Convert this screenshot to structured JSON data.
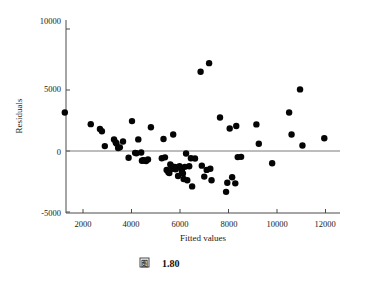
{
  "figure": {
    "caption_symbol": "图",
    "caption_number": "1.80"
  },
  "chart_data": {
    "type": "scatter",
    "title": "",
    "xlabel": "Fitted values",
    "ylabel": "Residuals",
    "xlim": [
      1100,
      12400
    ],
    "ylim": [
      -5000,
      10000
    ],
    "xticks": [
      2000,
      4000,
      6000,
      8000,
      10000,
      12000
    ],
    "xtick_labels": [
      "2000",
      "4000",
      "6000",
      "8000",
      "10000",
      "12000"
    ],
    "yticks": [
      -5000,
      0,
      5000,
      10000
    ],
    "ytick_labels": [
      "-5000",
      "0",
      "5000",
      "10000"
    ],
    "grid": false,
    "legend": null,
    "reference_line": {
      "orientation": "horizontal",
      "y": 0
    },
    "marker": {
      "shape": "circle",
      "color": "#050505",
      "size": 3.2
    },
    "points": [
      {
        "x": 1250,
        "y": 3150
      },
      {
        "x": 2320,
        "y": 2200
      },
      {
        "x": 2700,
        "y": 1800
      },
      {
        "x": 2780,
        "y": 1620
      },
      {
        "x": 2900,
        "y": 400
      },
      {
        "x": 3280,
        "y": 950
      },
      {
        "x": 3350,
        "y": 700
      },
      {
        "x": 3380,
        "y": 620
      },
      {
        "x": 3450,
        "y": 250
      },
      {
        "x": 3520,
        "y": 300
      },
      {
        "x": 3650,
        "y": 780
      },
      {
        "x": 3880,
        "y": -550
      },
      {
        "x": 4020,
        "y": 2450
      },
      {
        "x": 4150,
        "y": -150
      },
      {
        "x": 4200,
        "y": -180
      },
      {
        "x": 4280,
        "y": 950
      },
      {
        "x": 4400,
        "y": -120
      },
      {
        "x": 4430,
        "y": -800
      },
      {
        "x": 4480,
        "y": -750
      },
      {
        "x": 4520,
        "y": -780
      },
      {
        "x": 4600,
        "y": -820
      },
      {
        "x": 4680,
        "y": -700
      },
      {
        "x": 4800,
        "y": 1950
      },
      {
        "x": 5250,
        "y": -600
      },
      {
        "x": 5320,
        "y": 980
      },
      {
        "x": 5380,
        "y": -520
      },
      {
        "x": 5450,
        "y": -1550
      },
      {
        "x": 5520,
        "y": -1750
      },
      {
        "x": 5560,
        "y": -1800
      },
      {
        "x": 5600,
        "y": -1100
      },
      {
        "x": 5650,
        "y": -1250
      },
      {
        "x": 5700,
        "y": -1450
      },
      {
        "x": 5720,
        "y": 1350
      },
      {
        "x": 5780,
        "y": -1300
      },
      {
        "x": 5820,
        "y": -1500
      },
      {
        "x": 5880,
        "y": -1350
      },
      {
        "x": 5920,
        "y": -2050
      },
      {
        "x": 5980,
        "y": -1250
      },
      {
        "x": 6050,
        "y": -1400
      },
      {
        "x": 6080,
        "y": -1650
      },
      {
        "x": 6120,
        "y": -1850
      },
      {
        "x": 6150,
        "y": -2300
      },
      {
        "x": 6200,
        "y": -1300
      },
      {
        "x": 6250,
        "y": -200
      },
      {
        "x": 6300,
        "y": -2400
      },
      {
        "x": 6380,
        "y": -1250
      },
      {
        "x": 6450,
        "y": -600
      },
      {
        "x": 6500,
        "y": -2900
      },
      {
        "x": 6620,
        "y": -620
      },
      {
        "x": 6850,
        "y": 6500
      },
      {
        "x": 6900,
        "y": -1200
      },
      {
        "x": 7000,
        "y": -2100
      },
      {
        "x": 7100,
        "y": -1550
      },
      {
        "x": 7200,
        "y": 7200
      },
      {
        "x": 7250,
        "y": -1450
      },
      {
        "x": 7300,
        "y": -2400
      },
      {
        "x": 7650,
        "y": 2750
      },
      {
        "x": 7900,
        "y": -3350
      },
      {
        "x": 7950,
        "y": -2600
      },
      {
        "x": 8050,
        "y": 1850
      },
      {
        "x": 8150,
        "y": -2150
      },
      {
        "x": 8280,
        "y": -2650
      },
      {
        "x": 8320,
        "y": 2050
      },
      {
        "x": 8380,
        "y": -500
      },
      {
        "x": 8520,
        "y": -480
      },
      {
        "x": 9150,
        "y": 2180
      },
      {
        "x": 9250,
        "y": 600
      },
      {
        "x": 9800,
        "y": -1000
      },
      {
        "x": 10500,
        "y": 3150
      },
      {
        "x": 10600,
        "y": 1350
      },
      {
        "x": 10950,
        "y": 5050
      },
      {
        "x": 11050,
        "y": 450
      },
      {
        "x": 11950,
        "y": 1050
      }
    ]
  }
}
